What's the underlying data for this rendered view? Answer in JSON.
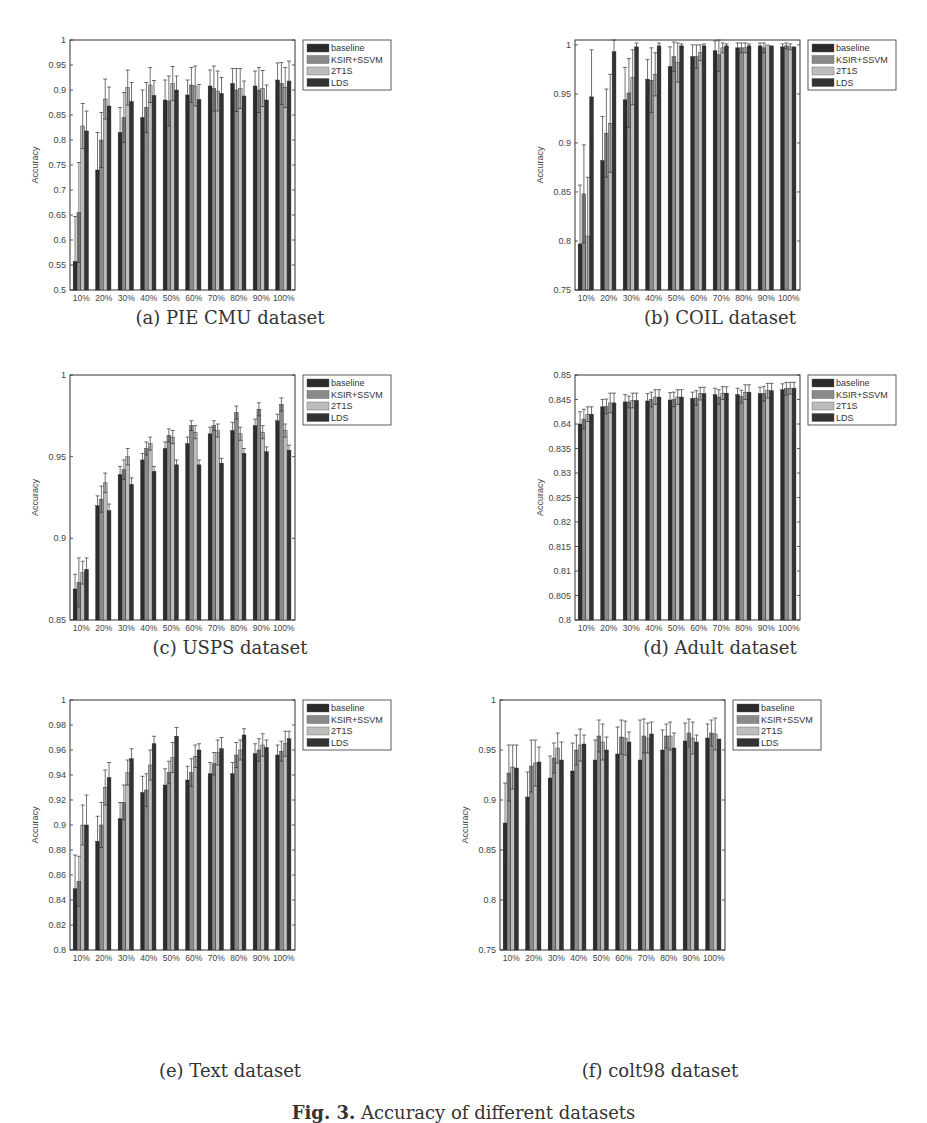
{
  "figure": {
    "caption_label": "Fig. 3.",
    "caption_text": "Accuracy of different datasets"
  },
  "legend": [
    "baseline",
    "KSIR+SSVM",
    "2T1S",
    "LDS"
  ],
  "colors": {
    "baseline": "#2b2b2b",
    "KSIR+SSVM": "#8a8a8a",
    "2T1S": "#bdbdbd",
    "LDS": "#333333"
  },
  "chart_data": [
    {
      "id": "a",
      "type": "bar",
      "title": "(a) PIE CMU dataset",
      "xlabel": "The Percentages of Labeled data",
      "ylabel": "Accuracy",
      "categories": [
        "10%",
        "20%",
        "30%",
        "40%",
        "50%",
        "60%",
        "70%",
        "80%",
        "90%",
        "100%"
      ],
      "ylim": [
        0.5,
        1
      ],
      "yticks": [
        0.5,
        0.55,
        0.6,
        0.65,
        0.7,
        0.75,
        0.8,
        0.85,
        0.9,
        0.95,
        1
      ],
      "ytick_labels": [
        "0.5",
        "0.55",
        "0.6",
        "0.65",
        "0.7",
        "0.75",
        "0.8",
        "0.85",
        "0.9",
        "0.95",
        "1"
      ],
      "legend_position": "outside-right-top",
      "series": [
        {
          "name": "baseline",
          "values": [
            0.557,
            0.74,
            0.815,
            0.845,
            0.88,
            0.89,
            0.908,
            0.913,
            0.908,
            0.92
          ],
          "errors": [
            0.09,
            0.075,
            0.05,
            0.055,
            0.04,
            0.03,
            0.032,
            0.03,
            0.03,
            0.034
          ]
        },
        {
          "name": "KSIR+SSVM",
          "values": [
            0.655,
            0.8,
            0.845,
            0.865,
            0.878,
            0.91,
            0.903,
            0.9,
            0.9,
            0.913
          ],
          "errors": [
            0.1,
            0.055,
            0.05,
            0.05,
            0.05,
            0.035,
            0.045,
            0.043,
            0.045,
            0.042
          ]
        },
        {
          "name": "2T1S",
          "values": [
            0.828,
            0.882,
            0.905,
            0.91,
            0.913,
            0.908,
            0.898,
            0.903,
            0.903,
            0.905
          ],
          "errors": [
            0.045,
            0.04,
            0.035,
            0.035,
            0.034,
            0.04,
            0.04,
            0.04,
            0.036,
            0.04
          ]
        },
        {
          "name": "LDS",
          "values": [
            0.818,
            0.868,
            0.877,
            0.889,
            0.9,
            0.881,
            0.893,
            0.888,
            0.88,
            0.918
          ],
          "errors": [
            0.04,
            0.038,
            0.038,
            0.03,
            0.028,
            0.03,
            0.032,
            0.03,
            0.03,
            0.04
          ]
        }
      ]
    },
    {
      "id": "b",
      "type": "bar",
      "title": "(b) COIL dataset",
      "xlabel": "The Percentages of Labeled data",
      "ylabel": "Accuracy",
      "categories": [
        "10%",
        "20%",
        "30%",
        "40%",
        "50%",
        "60%",
        "70%",
        "80%",
        "90%",
        "100%"
      ],
      "ylim": [
        0.75,
        1.005
      ],
      "yticks": [
        0.75,
        0.8,
        0.85,
        0.9,
        0.95,
        1
      ],
      "ytick_labels": [
        "0.75",
        "0.8",
        "0.85",
        "0.9",
        "0.95",
        "1"
      ],
      "legend_position": "outside-right-top",
      "series": [
        {
          "name": "baseline",
          "values": [
            0.797,
            0.882,
            0.944,
            0.965,
            0.978,
            0.988,
            0.994,
            0.997,
            0.999,
            0.998
          ],
          "errors": [
            0.06,
            0.045,
            0.033,
            0.02,
            0.02,
            0.012,
            0.01,
            0.005,
            0.003,
            0.003
          ]
        },
        {
          "name": "KSIR+SSVM",
          "values": [
            0.848,
            0.91,
            0.951,
            0.964,
            0.988,
            0.988,
            0.99,
            0.997,
            0.997,
            0.999
          ],
          "errors": [
            0.05,
            0.045,
            0.035,
            0.033,
            0.015,
            0.012,
            0.017,
            0.005,
            0.005,
            0.003
          ]
        },
        {
          "name": "2T1S",
          "values": [
            0.805,
            0.92,
            0.967,
            0.97,
            0.982,
            0.992,
            0.997,
            0.997,
            1.0,
            0.998
          ],
          "errors": [
            0.06,
            0.05,
            0.028,
            0.022,
            0.02,
            0.008,
            0.005,
            0.005,
            0.0,
            0.003
          ]
        },
        {
          "name": "LDS",
          "values": [
            0.947,
            0.993,
            0.998,
            0.999,
            0.999,
            0.999,
            0.999,
            0.999,
            0.999,
            0.998
          ],
          "errors": [
            0.048,
            0.012,
            0.004,
            0.003,
            0.002,
            0.002,
            0.002,
            0.002,
            0.0,
            0.0
          ]
        }
      ]
    },
    {
      "id": "c",
      "type": "bar",
      "title": "(c) USPS dataset",
      "xlabel": "The Percentages of Labeled data",
      "ylabel": "Accuracy",
      "categories": [
        "10%",
        "20%",
        "30%",
        "40%",
        "50%",
        "60%",
        "70%",
        "80%",
        "90%",
        "100%"
      ],
      "ylim": [
        0.85,
        1.0
      ],
      "yticks": [
        0.85,
        0.9,
        0.95,
        1
      ],
      "ytick_labels": [
        "0.85",
        "0.9",
        "0.95",
        "1"
      ],
      "legend_position": "outside-right-top",
      "series": [
        {
          "name": "baseline",
          "values": [
            0.869,
            0.92,
            0.939,
            0.948,
            0.955,
            0.958,
            0.964,
            0.966,
            0.969,
            0.972
          ],
          "errors": [
            0.009,
            0.006,
            0.005,
            0.004,
            0.004,
            0.004,
            0.004,
            0.005,
            0.004,
            0.004
          ]
        },
        {
          "name": "KSIR+SSVM",
          "values": [
            0.873,
            0.924,
            0.942,
            0.955,
            0.963,
            0.969,
            0.969,
            0.977,
            0.979,
            0.982
          ],
          "errors": [
            0.015,
            0.008,
            0.006,
            0.004,
            0.004,
            0.003,
            0.003,
            0.004,
            0.004,
            0.004
          ]
        },
        {
          "name": "2T1S",
          "values": [
            0.879,
            0.934,
            0.95,
            0.958,
            0.962,
            0.965,
            0.966,
            0.964,
            0.965,
            0.966
          ],
          "errors": [
            0.007,
            0.006,
            0.005,
            0.004,
            0.004,
            0.004,
            0.004,
            0.004,
            0.004,
            0.004
          ]
        },
        {
          "name": "LDS",
          "values": [
            0.881,
            0.917,
            0.933,
            0.941,
            0.945,
            0.945,
            0.946,
            0.952,
            0.953,
            0.954
          ],
          "errors": [
            0.007,
            0.004,
            0.004,
            0.003,
            0.003,
            0.003,
            0.003,
            0.003,
            0.003,
            0.003
          ]
        }
      ]
    },
    {
      "id": "d",
      "type": "bar",
      "title": "(d) Adult dataset",
      "xlabel": "The Percentages of Labeled data",
      "ylabel": "Accuracy",
      "categories": [
        "10%",
        "20%",
        "30%",
        "40%",
        "50%",
        "60%",
        "70%",
        "80%",
        "90%",
        "100%"
      ],
      "ylim": [
        0.8,
        0.85
      ],
      "yticks": [
        0.8,
        0.805,
        0.81,
        0.815,
        0.82,
        0.825,
        0.83,
        0.835,
        0.84,
        0.845,
        0.85
      ],
      "ytick_labels": [
        "0.8",
        "0.805",
        "0.81",
        "0.815",
        "0.82",
        "0.825",
        "0.83",
        "0.835",
        "0.84",
        "0.845",
        "0.85"
      ],
      "legend_position": "outside-right-top",
      "series": [
        {
          "name": "baseline",
          "values": [
            0.84,
            0.8435,
            0.8445,
            0.8447,
            0.8449,
            0.8452,
            0.846,
            0.846,
            0.8462,
            0.847
          ],
          "errors": [
            0.0025,
            0.0015,
            0.0015,
            0.0015,
            0.0015,
            0.0013,
            0.0013,
            0.0013,
            0.0013,
            0.0012
          ]
        },
        {
          "name": "KSIR+SSVM",
          "values": [
            0.841,
            0.8436,
            0.8445,
            0.845,
            0.845,
            0.8453,
            0.8455,
            0.8456,
            0.8462,
            0.8472
          ],
          "errors": [
            0.002,
            0.0015,
            0.0012,
            0.0015,
            0.0015,
            0.0015,
            0.0015,
            0.0013,
            0.0015,
            0.0013
          ]
        },
        {
          "name": "2T1S",
          "values": [
            0.842,
            0.8443,
            0.8448,
            0.8455,
            0.8455,
            0.8462,
            0.8463,
            0.8465,
            0.8468,
            0.8473
          ],
          "errors": [
            0.0015,
            0.002,
            0.0015,
            0.0015,
            0.0015,
            0.0013,
            0.0013,
            0.0015,
            0.0015,
            0.0012
          ]
        },
        {
          "name": "LDS",
          "values": [
            0.842,
            0.8443,
            0.8448,
            0.8455,
            0.8455,
            0.8462,
            0.8463,
            0.8465,
            0.8468,
            0.8473
          ],
          "errors": [
            0.0015,
            0.002,
            0.0015,
            0.0015,
            0.0015,
            0.0013,
            0.0013,
            0.0015,
            0.0015,
            0.0012
          ]
        }
      ]
    },
    {
      "id": "e",
      "type": "bar",
      "title": "(e) Text dataset",
      "xlabel": "The Percentages of Labeled data",
      "ylabel": "Accuracy",
      "categories": [
        "10%",
        "20%",
        "30%",
        "40%",
        "50%",
        "60%",
        "70%",
        "80%",
        "90%",
        "100%"
      ],
      "ylim": [
        0.8,
        1.0
      ],
      "yticks": [
        0.8,
        0.82,
        0.84,
        0.86,
        0.88,
        0.9,
        0.92,
        0.94,
        0.96,
        0.98,
        1
      ],
      "ytick_labels": [
        "0.8",
        "0.82",
        "0.84",
        "0.86",
        "0.88",
        "0.9",
        "0.92",
        "0.94",
        "0.96",
        "0.98",
        "1"
      ],
      "legend_position": "outside-right-top",
      "series": [
        {
          "name": "baseline",
          "values": [
            0.849,
            0.887,
            0.905,
            0.926,
            0.932,
            0.936,
            0.941,
            0.941,
            0.957,
            0.956
          ],
          "errors": [
            0.027,
            0.02,
            0.013,
            0.013,
            0.013,
            0.011,
            0.009,
            0.009,
            0.008,
            0.008
          ]
        },
        {
          "name": "KSIR+SSVM",
          "values": [
            0.855,
            0.9,
            0.918,
            0.928,
            0.942,
            0.942,
            0.949,
            0.956,
            0.96,
            0.959
          ],
          "errors": [
            0.02,
            0.018,
            0.014,
            0.013,
            0.009,
            0.011,
            0.009,
            0.01,
            0.009,
            0.008
          ]
        },
        {
          "name": "2T1S",
          "values": [
            0.9,
            0.93,
            0.942,
            0.948,
            0.954,
            0.955,
            0.958,
            0.96,
            0.964,
            0.965
          ],
          "errors": [
            0.016,
            0.014,
            0.01,
            0.012,
            0.012,
            0.009,
            0.01,
            0.008,
            0.009,
            0.01
          ]
        },
        {
          "name": "LDS",
          "values": [
            0.9,
            0.938,
            0.953,
            0.965,
            0.971,
            0.96,
            0.961,
            0.972,
            0.962,
            0.969
          ],
          "errors": [
            0.024,
            0.012,
            0.008,
            0.006,
            0.007,
            0.005,
            0.009,
            0.005,
            0.006,
            0.006
          ]
        }
      ]
    },
    {
      "id": "f",
      "type": "bar",
      "title": "(f) colt98 dataset",
      "xlabel": "The Percentages of Labeled data",
      "ylabel": "Accuracy",
      "categories": [
        "10%",
        "20%",
        "30%",
        "40%",
        "50%",
        "60%",
        "70%",
        "80%",
        "90%",
        "100%"
      ],
      "ylim": [
        0.75,
        1.0
      ],
      "yticks": [
        0.75,
        0.8,
        0.85,
        0.9,
        0.95,
        1
      ],
      "ytick_labels": [
        "0.75",
        "0.8",
        "0.85",
        "0.9",
        "0.95",
        "1"
      ],
      "legend_position": "outside-right-top",
      "series": [
        {
          "name": "baseline",
          "values": [
            0.877,
            0.903,
            0.922,
            0.929,
            0.94,
            0.946,
            0.94,
            0.95,
            0.959,
            0.962
          ],
          "errors": [
            0.04,
            0.025,
            0.022,
            0.028,
            0.02,
            0.027,
            0.04,
            0.02,
            0.018,
            0.014
          ]
        },
        {
          "name": "KSIR+SSVM",
          "values": [
            0.927,
            0.934,
            0.942,
            0.95,
            0.964,
            0.963,
            0.964,
            0.964,
            0.967,
            0.967
          ],
          "errors": [
            0.028,
            0.026,
            0.015,
            0.015,
            0.016,
            0.017,
            0.017,
            0.012,
            0.014,
            0.013
          ]
        },
        {
          "name": "2T1S",
          "values": [
            0.933,
            0.937,
            0.952,
            0.955,
            0.958,
            0.962,
            0.962,
            0.964,
            0.962,
            0.966
          ],
          "errors": [
            0.022,
            0.023,
            0.015,
            0.016,
            0.018,
            0.017,
            0.015,
            0.014,
            0.016,
            0.016
          ]
        },
        {
          "name": "LDS",
          "values": [
            0.932,
            0.938,
            0.94,
            0.956,
            0.95,
            0.958,
            0.966,
            0.952,
            0.958,
            0.961
          ],
          "errors": [
            0.023,
            0.015,
            0.018,
            0.009,
            0.013,
            0.01,
            0.012,
            0.015,
            0.007,
            0.0
          ]
        }
      ]
    }
  ]
}
